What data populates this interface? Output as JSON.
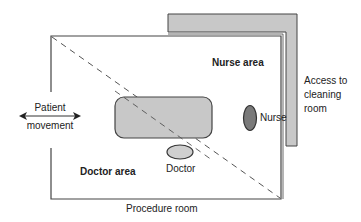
{
  "diagram": {
    "room_label": "Procedure room",
    "zones": {
      "nurse_area": "Nurse area",
      "doctor_area": "Doctor area"
    },
    "people": {
      "nurse": "Nurse",
      "doctor": "Doctor"
    },
    "patient_movement": {
      "line1": "Patient",
      "line2": "movement"
    },
    "cleaning_access": {
      "line1": "Access to",
      "line2": "cleaning",
      "line3": "room"
    },
    "colors": {
      "wall_fill": "#c8c8c8",
      "table_fill": "#c8c8c8",
      "nurse_fill": "#7a7a7a",
      "doctor_fill": "#cfcfcf",
      "line": "#444444"
    }
  }
}
